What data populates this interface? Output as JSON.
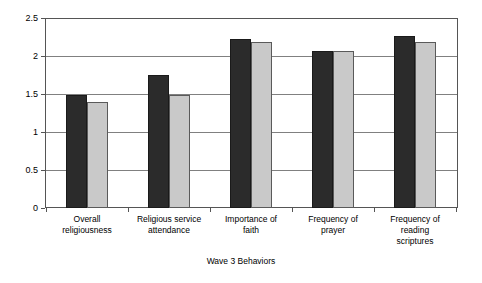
{
  "chart_data": {
    "type": "bar",
    "title": "",
    "xlabel": "Wave 3 Behaviors",
    "ylabel": "",
    "ylim": [
      0,
      2.5
    ],
    "ytick_labels": [
      "0",
      "0.5",
      "1",
      "1.5",
      "2",
      "2.5"
    ],
    "ytick_values": [
      0,
      0.5,
      1,
      1.5,
      2,
      2.5
    ],
    "grid": true,
    "legend": "none",
    "categories": [
      "Overall religiousness",
      "Religious service attendance",
      "Importance of faith",
      "Frequency of prayer",
      "Frequency of reading scriptures"
    ],
    "category_lines": [
      [
        "Overall",
        "religiousness"
      ],
      [
        "Religious service",
        "attendance"
      ],
      [
        "Importance of",
        "faith"
      ],
      [
        "Frequency of",
        "prayer"
      ],
      [
        "Frequency of",
        "reading",
        "scriptures"
      ]
    ],
    "series": [
      {
        "name": "series-dark",
        "color": "#2b2b2b",
        "values": [
          1.49,
          1.75,
          2.22,
          2.06,
          2.26
        ]
      },
      {
        "name": "series-light",
        "color": "#c9c9c9",
        "values": [
          1.4,
          1.49,
          2.19,
          2.06,
          2.19
        ]
      }
    ]
  }
}
